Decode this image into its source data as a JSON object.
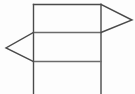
{
  "canvas": {
    "width": 135,
    "height": 94,
    "background_color": "#fdfdfd",
    "title": "Geometric line figure"
  },
  "style": {
    "stroke_color": "#4a4a4a",
    "stroke_color_light": "#6b6b6b",
    "stroke_width": 1.4,
    "fill": "none"
  },
  "figure": {
    "rectangle": {
      "name": "main-rectangle",
      "left_x": 33.5,
      "right_x": 101,
      "top_y": 4.5,
      "bottom_y": 94,
      "bottom_open": true
    },
    "divider_lines": [
      {
        "name": "upper-divider",
        "y": 32.5,
        "x1": 33.5,
        "x2": 101
      },
      {
        "name": "lower-divider",
        "y": 61.5,
        "x1": 33.5,
        "x2": 101
      }
    ],
    "triangles": [
      {
        "name": "right-pointing-triangle",
        "direction": "right",
        "base_x": 101,
        "base_top_y": 4.5,
        "base_bottom_y": 32.5,
        "apex_x": 132,
        "apex_y": 20
      },
      {
        "name": "left-pointing-triangle",
        "direction": "left",
        "base_x": 33.5,
        "base_top_y": 32.5,
        "base_bottom_y": 61.5,
        "apex_x": 6,
        "apex_y": 48
      }
    ],
    "vertical_edges": [
      {
        "name": "left-vertical-edge",
        "x": 33.5,
        "y1": 4.5,
        "y2": 94
      },
      {
        "name": "right-vertical-edge",
        "x": 101,
        "y1": 4.5,
        "y2": 94
      }
    ],
    "horizontal_edges": [
      {
        "name": "top-edge",
        "y": 4.5,
        "x1": 33.5,
        "x2": 101
      }
    ]
  }
}
